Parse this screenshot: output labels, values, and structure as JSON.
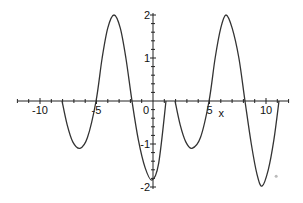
{
  "chart_data": {
    "type": "line",
    "title": "",
    "xlabel": "x",
    "ylabel": "",
    "xlim": [
      -12,
      12
    ],
    "ylim": [
      -2,
      2
    ],
    "grid": false,
    "legend": null,
    "x_ticks": [
      -10,
      -5,
      0,
      5,
      10
    ],
    "x_tick_labels": [
      "-10",
      "-5",
      "0",
      "5",
      "10"
    ],
    "y_ticks": [
      2,
      1,
      -1,
      -2
    ],
    "y_tick_labels": [
      "2",
      "1",
      "-1",
      "-2"
    ],
    "series": [
      {
        "name": "segment-1",
        "color": "#333333",
        "points": [
          [
            -8.05,
            0
          ],
          [
            -7.6,
            -0.55
          ],
          [
            -7.1,
            -0.95
          ],
          [
            -6.46,
            -1.1
          ],
          [
            -5.8,
            -0.85
          ],
          [
            -5.04,
            0
          ],
          [
            -4.5,
            1.0
          ],
          [
            -4.0,
            1.7
          ],
          [
            -3.45,
            2.0
          ],
          [
            -2.9,
            1.7
          ],
          [
            -2.4,
            1.0
          ],
          [
            -1.86,
            0
          ],
          [
            -1.3,
            -0.9
          ],
          [
            -0.7,
            -1.55
          ],
          [
            -0.1,
            -1.84
          ],
          [
            0.5,
            -1.45
          ],
          [
            1.15,
            0
          ]
        ]
      },
      {
        "name": "segment-2",
        "color": "#333333",
        "points": [
          [
            1.95,
            0
          ],
          [
            2.4,
            -0.55
          ],
          [
            2.9,
            -0.95
          ],
          [
            3.45,
            -1.1
          ],
          [
            4.2,
            -0.85
          ],
          [
            4.96,
            0
          ],
          [
            5.5,
            1.0
          ],
          [
            6.0,
            1.7
          ],
          [
            6.46,
            2.0
          ],
          [
            7.0,
            1.7
          ],
          [
            7.6,
            1.0
          ],
          [
            8.14,
            0
          ],
          [
            8.7,
            -1.0
          ],
          [
            9.2,
            -1.7
          ],
          [
            9.65,
            -1.98
          ],
          [
            10.2,
            -1.6
          ],
          [
            10.7,
            -0.9
          ],
          [
            11.15,
            0
          ]
        ]
      }
    ],
    "annotations": [
      {
        "type": "dot",
        "x": 10.9,
        "y": -1.75,
        "color": "#bbbbbb"
      }
    ]
  }
}
